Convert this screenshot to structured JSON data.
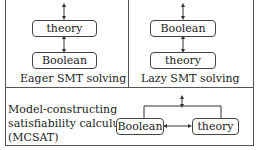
{
  "panels": {
    "eager": {
      "caption": "Eager SMT solving",
      "top_box": "theory",
      "bottom_box": "Boolean"
    },
    "lazy": {
      "caption": "Lazy SMT solving",
      "top_box": "Boolean",
      "bottom_box": "theory"
    },
    "mcsat": {
      "caption_lines": [
        "Model-constructing",
        "satisfiability calculus",
        "(MCSAT)"
      ],
      "left_box": "Boolean",
      "right_box": "theory"
    }
  }
}
